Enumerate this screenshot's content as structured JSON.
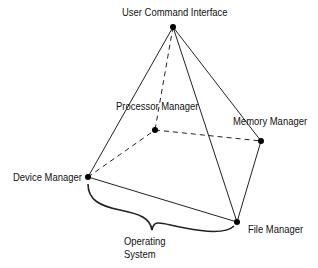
{
  "diagram": {
    "type": "pyramid",
    "nodes": [
      {
        "id": "apex",
        "label": "User Command Interface"
      },
      {
        "id": "processor",
        "label": "Processor Manager"
      },
      {
        "id": "memory",
        "label": "Memory Manager"
      },
      {
        "id": "device",
        "label": "Device Manager"
      },
      {
        "id": "file",
        "label": "File Manager"
      }
    ],
    "edges": [
      {
        "from": "apex",
        "to": "device",
        "style": "solid"
      },
      {
        "from": "apex",
        "to": "file",
        "style": "solid"
      },
      {
        "from": "apex",
        "to": "memory",
        "style": "solid"
      },
      {
        "from": "apex",
        "to": "processor",
        "style": "dashed"
      },
      {
        "from": "device",
        "to": "file",
        "style": "solid"
      },
      {
        "from": "file",
        "to": "memory",
        "style": "solid"
      },
      {
        "from": "device",
        "to": "processor",
        "style": "dashed"
      },
      {
        "from": "processor",
        "to": "memory",
        "style": "dashed"
      }
    ],
    "brace_label_line1": "Operating",
    "brace_label_line2": "System"
  }
}
